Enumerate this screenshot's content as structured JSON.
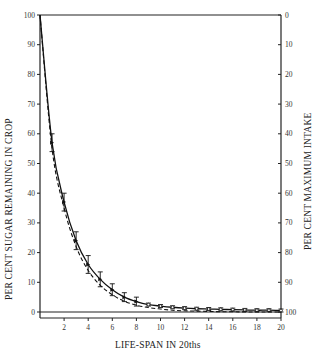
{
  "chart_data": {
    "type": "line",
    "title": "",
    "xlabel": "LIFE-SPAN IN 20ths",
    "ylabel": "PER CENT SUGAR REMAINING IN CROP",
    "ylabel_right": "PER CENT MAXIMUM INTAKE",
    "xlim": [
      0,
      20
    ],
    "ylim": [
      0,
      100
    ],
    "ylim_right": [
      100,
      0
    ],
    "x_ticks": [
      2,
      4,
      6,
      8,
      10,
      12,
      14,
      16,
      18,
      20
    ],
    "y_ticks_left": [
      0,
      10,
      20,
      30,
      40,
      50,
      60,
      70,
      80,
      90,
      100
    ],
    "y_ticks_right": [
      0,
      10,
      20,
      30,
      40,
      50,
      60,
      70,
      80,
      90,
      100
    ],
    "grid": false,
    "legend": null,
    "x": [
      0,
      1,
      2,
      3,
      4,
      5,
      6,
      7,
      8,
      9,
      10,
      11,
      12,
      13,
      14,
      15,
      16,
      17,
      18,
      19,
      20
    ],
    "series": [
      {
        "name": "observed (solid, with error bars)",
        "style": "solid",
        "values": [
          100,
          57,
          37,
          24,
          16,
          11,
          7.5,
          5,
          3.5,
          2.5,
          2,
          1.6,
          1.3,
          1.1,
          1,
          0.9,
          0.8,
          0.7,
          0.6,
          0.6,
          0.5
        ],
        "error": [
          0,
          3,
          3,
          3,
          3,
          2.5,
          2,
          1.5,
          1.5,
          0.5,
          0.5,
          0.5,
          0.5,
          0.5,
          0.5,
          0.5,
          0.5,
          0.5,
          0.5,
          0.5,
          0.5
        ]
      },
      {
        "name": "theoretical (dashed)",
        "style": "dashed",
        "values": [
          100,
          55,
          35,
          22,
          14,
          9,
          5.8,
          3.6,
          2.3,
          1.5,
          1,
          0.6,
          0.4,
          0.3,
          0.2,
          0.1,
          0.1,
          0,
          0,
          0,
          0
        ]
      }
    ],
    "annotations": []
  }
}
